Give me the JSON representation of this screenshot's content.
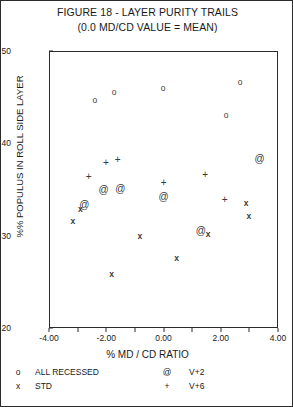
{
  "title": {
    "line1": "FIGURE 18 - LAYER PURITY TRAILS",
    "line2": "(0.0 MD/CD VALUE = MEAN)"
  },
  "chart_data": {
    "type": "scatter",
    "title": "FIGURE 18 - LAYER PURITY TRAILS",
    "subtitle": "(0.0 MD/CD VALUE = MEAN)",
    "xlabel": "% MD / CD RATIO",
    "ylabel": "%% POPULUS IN ROLL SIDE LAYER",
    "xlim": [
      -4.0,
      4.0
    ],
    "ylim": [
      20,
      50
    ],
    "xticks": [
      -4.0,
      -3.0,
      -2.0,
      -1.0,
      0.0,
      1.0,
      2.0,
      3.0,
      4.0
    ],
    "xticklabels": [
      "-4.00",
      "",
      "-2.00",
      "",
      "0.00",
      "",
      "2.00",
      "",
      "4.00"
    ],
    "yticks": [
      20,
      30,
      40,
      50
    ],
    "yticklabels": [
      "20",
      "30",
      "40",
      "50"
    ],
    "grid": false,
    "legend_position": "below-axis",
    "series": [
      {
        "name": "ALL RECESSED",
        "marker": "o",
        "points": [
          {
            "x": -2.43,
            "y": 44.8
          },
          {
            "x": -1.76,
            "y": 45.7
          },
          {
            "x": -0.05,
            "y": 46.1
          },
          {
            "x": 2.64,
            "y": 46.8
          },
          {
            "x": 2.15,
            "y": 43.2
          }
        ]
      },
      {
        "name": "STD",
        "marker": "x",
        "points": [
          {
            "x": -3.2,
            "y": 31.7
          },
          {
            "x": -2.94,
            "y": 33.0
          },
          {
            "x": -1.85,
            "y": 26.0
          },
          {
            "x": -0.86,
            "y": 30.1
          },
          {
            "x": 0.42,
            "y": 27.7
          },
          {
            "x": 1.52,
            "y": 30.3
          },
          {
            "x": 2.85,
            "y": 33.6
          },
          {
            "x": 2.95,
            "y": 32.2
          }
        ]
      },
      {
        "name": "V+2",
        "marker": "@",
        "points": [
          {
            "x": -2.8,
            "y": 33.5
          },
          {
            "x": -2.13,
            "y": 35.2
          },
          {
            "x": -1.54,
            "y": 35.3
          },
          {
            "x": -0.03,
            "y": 34.4
          },
          {
            "x": 1.27,
            "y": 30.7
          },
          {
            "x": 3.32,
            "y": 38.5
          }
        ]
      },
      {
        "name": "V+6",
        "marker": "+",
        "points": [
          {
            "x": -2.65,
            "y": 36.6
          },
          {
            "x": -2.05,
            "y": 38.1
          },
          {
            "x": -1.64,
            "y": 38.4
          },
          {
            "x": -0.03,
            "y": 35.9
          },
          {
            "x": 1.42,
            "y": 36.8
          },
          {
            "x": 2.1,
            "y": 34.1
          }
        ]
      }
    ]
  },
  "legend": {
    "rows": [
      {
        "sym_left": "o",
        "label_left": "ALL RECESSED",
        "sym_right": "@",
        "label_right": "V+2"
      },
      {
        "sym_left": "x",
        "label_left": "STD",
        "sym_right": "+",
        "label_right": "V+6"
      }
    ]
  }
}
